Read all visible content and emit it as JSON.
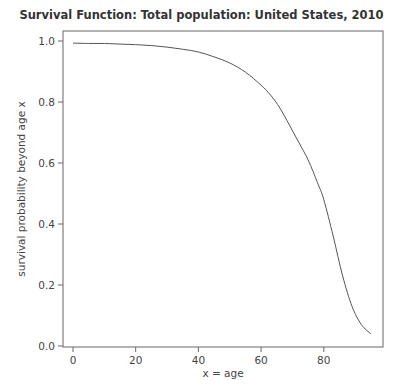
{
  "chart_data": {
    "type": "line",
    "title": "Survival Function: Total population: United States, 2010",
    "xlabel": "x = age",
    "ylabel": "survival probability beyond age x",
    "xlim": [
      -3,
      99
    ],
    "ylim": [
      -0.005,
      1.03
    ],
    "x_ticks": [
      0,
      20,
      40,
      60,
      80
    ],
    "y_ticks": [
      0.0,
      0.2,
      0.4,
      0.6,
      0.8,
      1.0
    ],
    "x_tick_labels": [
      "0",
      "20",
      "40",
      "60",
      "80"
    ],
    "y_tick_labels": [
      "0.0",
      "0.2",
      "0.4",
      "0.6",
      "0.8",
      "1.0"
    ],
    "grid": false,
    "legend": null,
    "series": [
      {
        "name": "Survival function",
        "color": "#555555",
        "x": [
          0,
          5,
          10,
          15,
          20,
          25,
          30,
          35,
          40,
          45,
          50,
          55,
          60,
          63,
          66,
          69,
          72,
          75,
          78,
          80,
          83,
          86,
          89,
          92,
          95
        ],
        "values": [
          0.993,
          0.992,
          0.992,
          0.99,
          0.988,
          0.985,
          0.98,
          0.973,
          0.964,
          0.948,
          0.928,
          0.898,
          0.855,
          0.823,
          0.78,
          0.725,
          0.668,
          0.61,
          0.535,
          0.48,
          0.36,
          0.23,
          0.13,
          0.07,
          0.04
        ]
      }
    ]
  }
}
